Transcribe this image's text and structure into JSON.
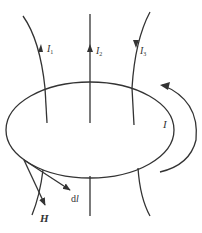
{
  "diagram": {
    "labels": {
      "current_1": "I",
      "current_1_sub": "1",
      "current_2": "I",
      "current_2_sub": "2",
      "current_3": "I",
      "current_3_sub": "3",
      "loop_current": "I",
      "line_element": "d",
      "line_element_l": "l",
      "field": "H"
    },
    "colors": {
      "stroke": "#333333",
      "background": "#ffffff"
    }
  }
}
